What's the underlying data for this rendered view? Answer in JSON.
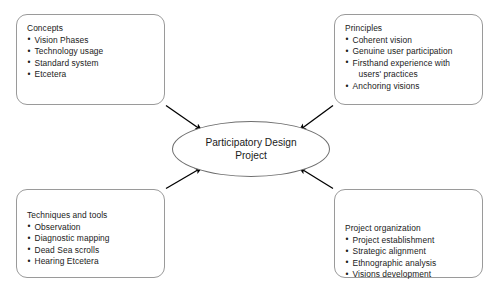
{
  "diagram": {
    "center": {
      "label_line1": "Participatory Design",
      "label_line2": "Project"
    },
    "boxes": [
      {
        "id": "concepts",
        "title": "Concepts",
        "items": [
          {
            "text": "Vision Phases"
          },
          {
            "text": "Technology usage"
          },
          {
            "text": "Standard system"
          },
          {
            "text": "Etcetera"
          }
        ]
      },
      {
        "id": "principles",
        "title": "Principles",
        "items": [
          {
            "text": "Coherent vision"
          },
          {
            "text": "Genuine user participation"
          },
          {
            "text": "Firsthand experience with",
            "text2": "users' practices"
          },
          {
            "text": "Anchoring visions"
          }
        ]
      },
      {
        "id": "techniques",
        "title": "Techniques and tools",
        "items": [
          {
            "text": "Observation"
          },
          {
            "text": "Diagnostic mapping"
          },
          {
            "text": "Dead Sea scrolls"
          },
          {
            "text": "Hearing Etcetera"
          }
        ]
      },
      {
        "id": "organization",
        "title": "Project organization",
        "items": [
          {
            "text": "Project establishment"
          },
          {
            "text": "Strategic alignment"
          },
          {
            "text": "Ethnographic analysis"
          },
          {
            "text": "Visions development"
          }
        ]
      }
    ],
    "bullet_glyph": "•",
    "arrows": [
      {
        "id": "concepts-to-center",
        "from": "concepts",
        "to": "center"
      },
      {
        "id": "principles-to-center",
        "from": "principles",
        "to": "center"
      },
      {
        "id": "techniques-to-center",
        "from": "techniques",
        "to": "center"
      },
      {
        "id": "organization-to-center",
        "from": "organization",
        "to": "center"
      }
    ],
    "colors": {
      "background": "#ffffff",
      "box_border": "#9a9a9a",
      "ellipse_border": "#6e6e6e",
      "arrow": "#000000",
      "text": "#1a1a1a"
    }
  }
}
